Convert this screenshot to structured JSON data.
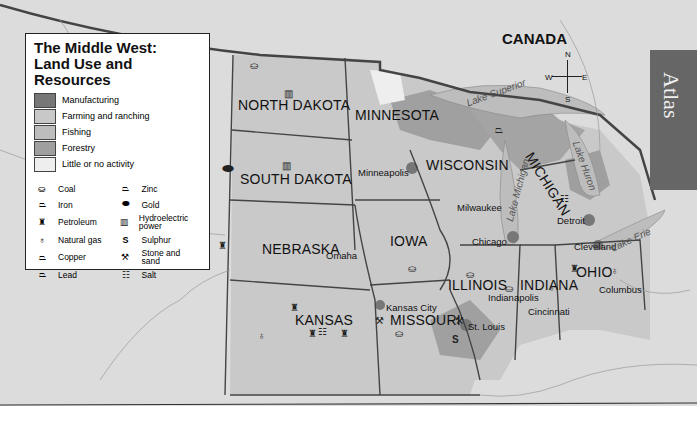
{
  "title": "The Middle West: Land Use and Resources",
  "title_lines": [
    "The Middle West:",
    "Land Use and",
    "Resources"
  ],
  "tab": "Atlas",
  "country_label": "CANADA",
  "compass": {
    "n": "N",
    "s": "S",
    "e": "E",
    "w": "W"
  },
  "legend": {
    "land_use": [
      {
        "label": "Manufacturing",
        "color": "#777777"
      },
      {
        "label": "Farming and ranching",
        "color": "#c8c8c8"
      },
      {
        "label": "Fishing",
        "color": "#bdbdbd"
      },
      {
        "label": "Forestry",
        "color": "#9f9f9f"
      },
      {
        "label": "Little or no activity",
        "color": "#eeeeee"
      }
    ],
    "resources": [
      {
        "label": "Coal",
        "icon": "coal-icon",
        "glyph": "⛀"
      },
      {
        "label": "Zinc",
        "icon": "zinc-icon",
        "glyph": "⏢"
      },
      {
        "label": "Iron",
        "icon": "iron-icon",
        "glyph": "⏢"
      },
      {
        "label": "Gold",
        "icon": "gold-icon",
        "glyph": "⬬"
      },
      {
        "label": "Petroleum",
        "icon": "petroleum-icon",
        "glyph": "♜"
      },
      {
        "label": "Hydroelectric power",
        "icon": "hydroelectric-icon",
        "glyph": "▥"
      },
      {
        "label": "Natural gas",
        "icon": "natural-gas-icon",
        "glyph": "♁"
      },
      {
        "label": "Sulphur",
        "icon": "sulphur-icon",
        "glyph": "S"
      },
      {
        "label": "Copper",
        "icon": "copper-icon",
        "glyph": "⏢"
      },
      {
        "label": "Stone and sand",
        "icon": "stone-sand-icon",
        "glyph": "⚒"
      },
      {
        "label": "Lead",
        "icon": "lead-icon",
        "glyph": "⏢"
      },
      {
        "label": "Salt",
        "icon": "salt-icon",
        "glyph": "☷"
      }
    ]
  },
  "states": {
    "north_dakota": "NORTH DAKOTA",
    "south_dakota": "SOUTH DAKOTA",
    "nebraska": "NEBRASKA",
    "kansas": "KANSAS",
    "minnesota": "MINNESOTA",
    "iowa": "IOWA",
    "missouri": "MISSOURI",
    "wisconsin": "WISCONSIN",
    "illinois": "ILLINOIS",
    "michigan": "MICHIGAN",
    "indiana": "INDIANA",
    "ohio": "OHIO"
  },
  "cities": {
    "minneapolis": "Minneapolis",
    "milwaukee": "Milwaukee",
    "chicago": "Chicago",
    "detroit": "Detroit",
    "cleveland": "Cleveland",
    "omaha": "Omaha",
    "kansas_city": "Kansas City",
    "st_louis": "St. Louis",
    "indianapolis": "Indianapolis",
    "cincinnati": "Cincinnati",
    "columbus": "Columbus"
  },
  "lakes": {
    "superior": "Lake Superior",
    "michigan": "Lake Michigan",
    "huron": "Lake Huron",
    "erie": "Lake Erie"
  }
}
